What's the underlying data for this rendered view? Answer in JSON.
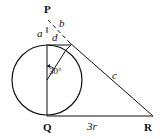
{
  "diagram": {
    "points": {
      "P": "P",
      "Q": "Q",
      "R": "R"
    },
    "segment_labels": {
      "a": "a",
      "b": "b",
      "c": "c",
      "d": "d",
      "QR": "3r"
    },
    "angle_label": "30°",
    "colors": {
      "stroke": "#111111",
      "background": "#ffffff"
    }
  }
}
